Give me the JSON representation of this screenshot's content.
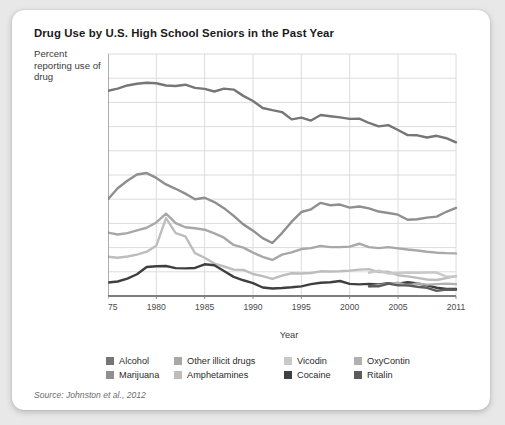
{
  "card": {
    "title": "Drug Use by U.S. High School Seniors in the Past Year",
    "axis_note": "Percent reporting use of drug",
    "source": "Source: Johnston et al., 2012",
    "background": "#ffffff",
    "page_background": "#e8e8e8"
  },
  "chart_data": {
    "type": "line",
    "title": "Drug Use by U.S. High School Seniors in the Past Year",
    "xlabel": "Year",
    "ylabel": "Percent reporting use of drug",
    "xlim": [
      1975,
      2011
    ],
    "ylim": [
      0,
      100
    ],
    "grid": true,
    "legend_position": "bottom",
    "xticks": [
      1975,
      1980,
      1985,
      1990,
      1995,
      2000,
      2005,
      2011
    ],
    "xtick_labels": [
      "1975",
      "1980",
      "1985",
      "1990",
      "1995",
      "2000",
      "2005",
      "2011"
    ],
    "yticks": [
      0,
      10,
      20,
      30,
      40,
      50,
      60,
      70,
      80,
      90,
      100
    ],
    "ytick_labels": [
      "0",
      "10",
      "20",
      "30",
      "40",
      "50",
      "60",
      "70",
      "80",
      "90",
      "100"
    ],
    "x": [
      1975,
      1976,
      1977,
      1978,
      1979,
      1980,
      1981,
      1982,
      1983,
      1984,
      1985,
      1986,
      1987,
      1988,
      1989,
      1990,
      1991,
      1992,
      1993,
      1994,
      1995,
      1996,
      1997,
      1998,
      1999,
      2000,
      2001,
      2002,
      2003,
      2004,
      2005,
      2006,
      2007,
      2008,
      2009,
      2010,
      2011
    ],
    "series": [
      {
        "name": "Alcohol",
        "color": "#767676",
        "values": [
          84.8,
          85.7,
          87.0,
          87.7,
          88.1,
          87.9,
          87.0,
          86.8,
          87.3,
          86.0,
          85.6,
          84.5,
          85.7,
          85.3,
          82.7,
          80.6,
          77.7,
          76.8,
          76.0,
          73.0,
          73.7,
          72.5,
          74.8,
          74.3,
          73.8,
          73.2,
          73.3,
          71.5,
          70.1,
          70.6,
          68.6,
          66.5,
          66.4,
          65.5,
          66.2,
          65.2,
          63.5
        ],
        "style": "solid"
      },
      {
        "name": "Marijuana",
        "color": "#8f8f8f",
        "values": [
          40.0,
          44.5,
          47.6,
          50.2,
          50.8,
          48.8,
          46.1,
          44.3,
          42.3,
          40.0,
          40.6,
          38.8,
          36.3,
          33.1,
          29.6,
          27.0,
          23.9,
          21.9,
          26.0,
          30.7,
          34.7,
          35.8,
          38.5,
          37.5,
          37.8,
          36.5,
          37.0,
          36.2,
          34.9,
          34.3,
          33.6,
          31.5,
          31.7,
          32.4,
          32.8,
          34.8,
          36.4
        ],
        "style": "solid"
      },
      {
        "name": "Other illicit drugs",
        "color": "#a8a8a8",
        "values": [
          26.2,
          25.4,
          26.0,
          27.1,
          28.2,
          30.4,
          34.0,
          30.1,
          28.4,
          28.0,
          27.4,
          25.9,
          24.1,
          21.1,
          20.0,
          17.9,
          16.2,
          14.9,
          17.1,
          18.0,
          19.4,
          19.8,
          20.7,
          20.2,
          20.2,
          20.4,
          21.6,
          20.2,
          19.8,
          20.2,
          19.7,
          19.2,
          18.8,
          18.3,
          17.9,
          17.7,
          17.6
        ],
        "style": "solid"
      },
      {
        "name": "Amphetamines",
        "color": "#bdbdbd",
        "values": [
          16.2,
          15.8,
          16.3,
          17.1,
          18.3,
          20.8,
          32.2,
          26.0,
          24.6,
          17.7,
          15.8,
          13.4,
          12.2,
          10.9,
          10.8,
          9.1,
          8.2,
          7.1,
          8.4,
          9.4,
          9.3,
          9.5,
          10.2,
          10.1,
          10.2,
          10.5,
          10.9,
          11.1,
          9.9,
          10.0,
          8.6,
          8.1,
          7.5,
          6.8,
          6.6,
          7.4,
          8.2
        ],
        "style": "solid"
      },
      {
        "name": "Cocaine",
        "color": "#3f3f3f",
        "values": [
          5.6,
          6.0,
          7.2,
          9.0,
          12.0,
          12.3,
          12.4,
          11.5,
          11.4,
          11.6,
          13.1,
          12.7,
          10.3,
          7.9,
          6.5,
          5.3,
          3.5,
          3.1,
          3.3,
          3.6,
          4.0,
          4.9,
          5.5,
          5.7,
          6.2,
          5.0,
          4.8,
          5.0,
          4.8,
          5.3,
          5.1,
          5.7,
          5.2,
          4.4,
          3.4,
          2.9,
          2.9
        ],
        "style": "solid"
      },
      {
        "name": "Vicodin",
        "color": "#c9c9c9",
        "values": [
          null,
          null,
          null,
          null,
          null,
          null,
          null,
          null,
          null,
          null,
          null,
          null,
          null,
          null,
          null,
          null,
          null,
          null,
          null,
          null,
          null,
          null,
          null,
          null,
          null,
          null,
          null,
          9.6,
          10.5,
          9.3,
          9.5,
          9.7,
          9.6,
          9.7,
          9.7,
          8.0,
          8.1
        ],
        "style": "solid"
      },
      {
        "name": "OxyContin",
        "color": "#b0b0b0",
        "values": [
          null,
          null,
          null,
          null,
          null,
          null,
          null,
          null,
          null,
          null,
          null,
          null,
          null,
          null,
          null,
          null,
          null,
          null,
          null,
          null,
          null,
          null,
          null,
          null,
          null,
          null,
          null,
          4.0,
          4.5,
          5.0,
          5.5,
          4.3,
          5.2,
          4.7,
          4.9,
          5.1,
          4.9
        ],
        "style": "solid"
      },
      {
        "name": "Ritalin",
        "color": "#5c5c5c",
        "values": [
          null,
          null,
          null,
          null,
          null,
          null,
          null,
          null,
          null,
          null,
          null,
          null,
          null,
          null,
          null,
          null,
          null,
          null,
          null,
          null,
          null,
          null,
          null,
          null,
          null,
          null,
          null,
          4.0,
          4.0,
          5.1,
          4.4,
          4.4,
          3.8,
          3.4,
          2.1,
          2.7,
          2.6
        ],
        "style": "solid"
      }
    ]
  },
  "legend": {
    "rows": [
      [
        {
          "label": "Alcohol",
          "color": "#767676"
        },
        {
          "label": "Other illicit drugs",
          "color": "#a8a8a8"
        },
        {
          "label": "Vicodin",
          "color": "#c9c9c9"
        },
        {
          "label": "OxyContin",
          "color": "#b0b0b0"
        }
      ],
      [
        {
          "label": "Marijuana",
          "color": "#8f8f8f"
        },
        {
          "label": "Amphetamines",
          "color": "#bdbdbd"
        },
        {
          "label": "Cocaine",
          "color": "#3f3f3f"
        },
        {
          "label": "Ritalin",
          "color": "#5c5c5c"
        }
      ]
    ]
  }
}
